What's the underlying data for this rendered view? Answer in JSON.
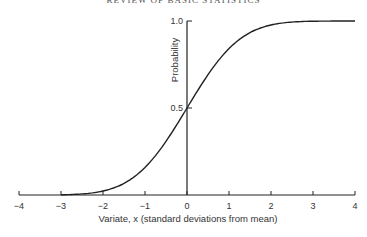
{
  "page": {
    "running_header": "REVIEW OF BASIC STATISTICS"
  },
  "chart_data": {
    "type": "line",
    "title": "",
    "xlabel": "Variate, x (standard deviations from mean)",
    "ylabel": "Probability",
    "x_ticks": [
      "−4",
      "−3",
      "−2",
      "−1",
      "0",
      "1",
      "2",
      "3",
      "4"
    ],
    "y_ticks": [
      "0.5",
      "1.0"
    ],
    "xlim": [
      -4,
      4
    ],
    "ylim": [
      0,
      1
    ],
    "grid": false,
    "legend": null,
    "series": [
      {
        "name": "Cumulative normal distribution",
        "x": [
          -4,
          -3.5,
          -3,
          -2.5,
          -2,
          -1.5,
          -1,
          -0.5,
          0,
          0.5,
          1,
          1.5,
          2,
          2.5,
          3,
          3.5,
          4
        ],
        "y": [
          0.0,
          0.0002,
          0.0013,
          0.0062,
          0.0228,
          0.0668,
          0.1587,
          0.3085,
          0.5,
          0.6915,
          0.8413,
          0.9332,
          0.9772,
          0.9938,
          0.9987,
          0.9998,
          1.0
        ]
      }
    ]
  }
}
